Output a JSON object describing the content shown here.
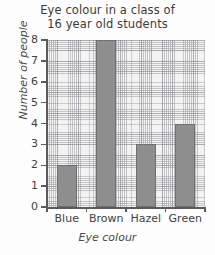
{
  "chart_data": {
    "type": "bar",
    "title": "Eye colour in a class of 16 year old students",
    "title_lines": [
      "Eye colour in a class of",
      "16 year old students"
    ],
    "categories": [
      "Blue",
      "Brown",
      "Hazel",
      "Green"
    ],
    "values": [
      2,
      8,
      3,
      4
    ],
    "xlabel": "Eye colour",
    "ylabel": "Number of people",
    "ylim": [
      0,
      8
    ],
    "ytick_labels": [
      "0",
      "1",
      "2",
      "3",
      "4",
      "5",
      "6",
      "7",
      "8"
    ],
    "ytick_values": [
      0,
      1,
      2,
      3,
      4,
      5,
      6,
      7,
      8
    ],
    "grid": true,
    "grid_style": "graph-paper",
    "legend": false,
    "bar_color": "#8e8e8e",
    "bar_edge_color": "#6f6f6f",
    "plot_background": "#f3f3f3",
    "axis_color": "#5a5a5a",
    "text_color": "#3f3f3f"
  }
}
